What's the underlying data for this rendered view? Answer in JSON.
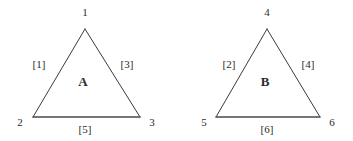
{
  "figure": {
    "background_color": "#ffffff",
    "line_color": "#3a3a3a",
    "base_line_color": "#4a4a4a",
    "text_color": "#2b2b2b",
    "triangles": [
      {
        "name": "A",
        "face_label": "A",
        "face_label_pos": [
          83,
          81
        ],
        "apex": [
          85,
          29
        ],
        "bottom_left": [
          33,
          117
        ],
        "bottom_right": [
          140,
          117
        ],
        "vertices": [
          {
            "label": "1",
            "pos": [
              85,
              12
            ]
          },
          {
            "label": "2",
            "pos": [
              20,
              122
            ]
          },
          {
            "label": "3",
            "pos": [
              152,
              122
            ]
          }
        ],
        "edges": [
          {
            "label": "[1]",
            "pos": [
              39,
              64
            ],
            "side": "left"
          },
          {
            "label": "[3]",
            "pos": [
              127,
              64
            ],
            "side": "right"
          },
          {
            "label": "[5]",
            "pos": [
              85,
              129
            ],
            "side": "bottom"
          }
        ]
      },
      {
        "name": "B",
        "face_label": "B",
        "face_label_pos": [
          265,
          81
        ],
        "apex": [
          267,
          29
        ],
        "bottom_left": [
          216,
          117
        ],
        "bottom_right": [
          320,
          117
        ],
        "vertices": [
          {
            "label": "4",
            "pos": [
              267,
              12
            ]
          },
          {
            "label": "5",
            "pos": [
              204,
              122
            ]
          },
          {
            "label": "6",
            "pos": [
              332,
              122
            ]
          }
        ],
        "edges": [
          {
            "label": "[2]",
            "pos": [
              229,
              64
            ],
            "side": "left"
          },
          {
            "label": "[4]",
            "pos": [
              308,
              64
            ],
            "side": "right"
          },
          {
            "label": "[6]",
            "pos": [
              267,
              129
            ],
            "side": "bottom"
          }
        ]
      }
    ]
  }
}
